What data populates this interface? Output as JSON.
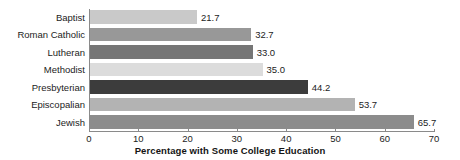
{
  "chart_data": {
    "type": "bar",
    "orientation": "horizontal",
    "title": "",
    "xlabel": "Percentage with Some College Education",
    "ylabel": "Denomination",
    "categories": [
      "Baptist",
      "Roman Catholic",
      "Lutheran",
      "Methodist",
      "Presbyterian",
      "Episcopalian",
      "Jewish"
    ],
    "values": [
      21.7,
      32.7,
      33.0,
      35.0,
      44.2,
      53.7,
      65.7
    ],
    "value_labels": [
      "21.7",
      "32.7",
      "33.0",
      "35.0",
      "44.2",
      "53.7",
      "65.7"
    ],
    "bar_colors": [
      "#c9c9c9",
      "#989898",
      "#767676",
      "#dcdcdc",
      "#3c3c3c",
      "#b3b3b3",
      "#8c8c8c"
    ],
    "xlim": [
      0,
      70
    ],
    "xticks": [
      0,
      10,
      20,
      30,
      40,
      50,
      60,
      70
    ],
    "xtick_labels": [
      "0",
      "10",
      "20",
      "30",
      "40",
      "50",
      "60",
      "70"
    ],
    "grid": false,
    "legend": false,
    "axis_color": "#8a8a8a",
    "background": "#ffffff",
    "text_color": "#1c1c1c"
  }
}
